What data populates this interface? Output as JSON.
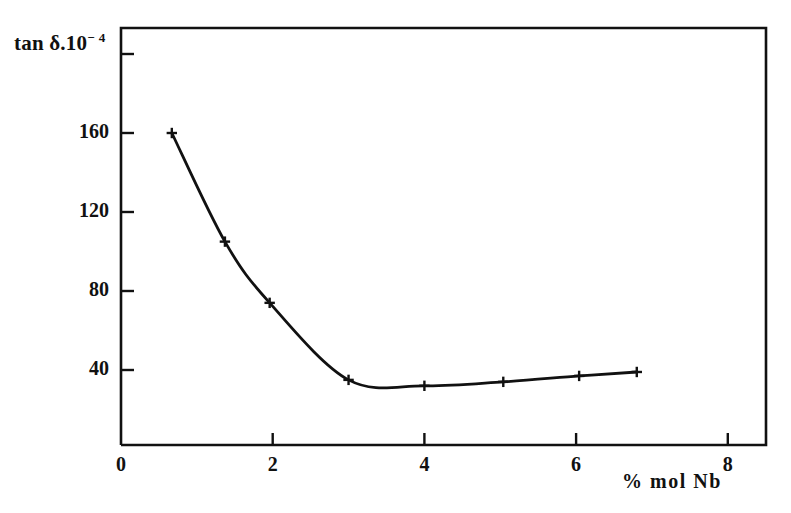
{
  "figure": {
    "background_color": "#ffffff",
    "line_color": "#111111",
    "y_axis_title": "tan δ.10",
    "y_axis_title_exponent": "− 4",
    "x_axis_title": "% mol Nb"
  },
  "chart_data": {
    "type": "line",
    "title": "",
    "subtitle": "",
    "xlabel": "% mol Nb",
    "ylabel": "tan δ.10⁻⁴",
    "xlim": [
      0,
      8.5
    ],
    "ylim": [
      0,
      200
    ],
    "grid": false,
    "legend": null,
    "marker": "plus",
    "x_ticks": [
      0,
      2,
      4,
      6,
      8
    ],
    "x_tick_labels": [
      "0",
      "2",
      "4",
      "6",
      "8"
    ],
    "y_ticks": [
      40,
      80,
      120,
      160,
      200
    ],
    "y_tick_labels": [
      "40",
      "80",
      "120",
      "160",
      ""
    ],
    "series": [
      {
        "name": "tan δ.10⁻⁴",
        "x": [
          0.67,
          1.37,
          1.96,
          3.0,
          4.0,
          5.04,
          6.04,
          6.8
        ],
        "values": [
          160,
          105,
          74,
          35,
          32,
          34,
          37,
          39
        ]
      }
    ]
  }
}
